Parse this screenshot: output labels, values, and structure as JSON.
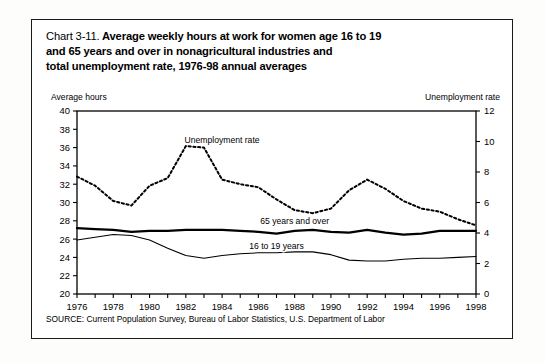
{
  "title": {
    "chart_number": "Chart 3-11.",
    "line1": "Average weekly hours at work for women age 16 to 19",
    "line2": "and 65 years and over in nonagricultural industries and",
    "line3": "total unemployment rate, 1976-98 annual averages"
  },
  "left_axis_caption": "Average hours",
  "right_axis_caption": "Unemployment rate",
  "source_note": "SOURCE: Current Population Survey, Bureau of Labor Statistics, U.S. Department of Labor",
  "colors": {
    "ink": "#000000",
    "frame": "#1a1a1a",
    "background": "#ffffff"
  },
  "chart_data": {
    "type": "line",
    "title": "Chart 3-11. Average weekly hours at work for women age 16 to 19 and 65 years and over in nonagricultural industries and total unemployment rate, 1976-98 annual averages",
    "xlabel": "",
    "ylabel": "Average hours",
    "y2label": "Unemployment rate",
    "xlim": [
      1976,
      1998
    ],
    "ylim": [
      20,
      40
    ],
    "y2lim": [
      0,
      12
    ],
    "yticks": [
      20,
      22,
      24,
      26,
      28,
      30,
      32,
      34,
      36,
      38,
      40
    ],
    "y2ticks": [
      0,
      2,
      4,
      6,
      8,
      10,
      12
    ],
    "xticks": [
      1976,
      1977,
      1978,
      1979,
      1980,
      1981,
      1982,
      1983,
      1984,
      1985,
      1986,
      1987,
      1988,
      1989,
      1990,
      1991,
      1992,
      1993,
      1994,
      1995,
      1996,
      1997,
      1998
    ],
    "xtick_labels": [
      "1976",
      "",
      "1978",
      "",
      "1980",
      "",
      "1982",
      "",
      "1984",
      "",
      "1986",
      "",
      "1988",
      "",
      "1990",
      "",
      "1992",
      "",
      "1994",
      "",
      "1996",
      "",
      "1998"
    ],
    "grid": false,
    "legend": "inline-annotations",
    "x": [
      1976,
      1977,
      1978,
      1979,
      1980,
      1981,
      1982,
      1983,
      1984,
      1985,
      1986,
      1987,
      1988,
      1989,
      1990,
      1991,
      1992,
      1993,
      1994,
      1995,
      1996,
      1997,
      1998
    ],
    "series": [
      {
        "name": "Unemployment rate",
        "axis": "right",
        "style": "dotted",
        "label_x": 1984,
        "label_y": 9.9,
        "values": [
          7.7,
          7.1,
          6.1,
          5.8,
          7.1,
          7.6,
          9.7,
          9.6,
          7.5,
          7.2,
          7.0,
          6.2,
          5.5,
          5.3,
          5.6,
          6.8,
          7.5,
          6.9,
          6.1,
          5.6,
          5.4,
          4.9,
          4.5
        ]
      },
      {
        "name": "65 years and over",
        "axis": "left",
        "style": "thick-solid",
        "label_x": 1988,
        "label_y": 27.6,
        "values": [
          27.2,
          27.1,
          27.0,
          26.8,
          26.9,
          26.9,
          27.0,
          27.0,
          27.0,
          26.9,
          26.8,
          26.6,
          26.9,
          27.0,
          26.8,
          26.7,
          27.0,
          26.7,
          26.5,
          26.6,
          26.9,
          26.9,
          26.9
        ]
      },
      {
        "name": "16 to 19 years",
        "axis": "left",
        "style": "thin-solid",
        "label_x": 1987,
        "label_y": 24.9,
        "values": [
          25.9,
          26.2,
          26.5,
          26.4,
          25.9,
          25.0,
          24.2,
          23.9,
          24.2,
          24.4,
          24.5,
          24.5,
          24.6,
          24.6,
          24.3,
          23.7,
          23.6,
          23.6,
          23.8,
          23.9,
          23.9,
          24.0,
          24.1
        ]
      }
    ]
  }
}
